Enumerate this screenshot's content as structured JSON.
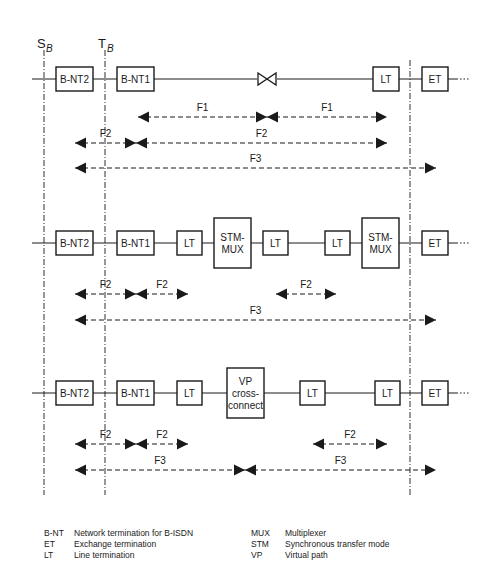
{
  "reference_points": [
    {
      "id": "sb",
      "label": "S",
      "sub": "B",
      "x": 44
    },
    {
      "id": "tb",
      "label": "T",
      "sub": "B",
      "x": 105
    }
  ],
  "boundary_x": 410,
  "rows": [
    {
      "y": 79,
      "line": [
        32,
        458
      ],
      "boxes": [
        {
          "label": [
            "B-NT2"
          ],
          "x": 56,
          "w": 37,
          "h": 24
        },
        {
          "label": [
            "B-NT1"
          ],
          "x": 117,
          "w": 37,
          "h": 24
        },
        {
          "label": [
            "LT"
          ],
          "x": 373,
          "w": 26,
          "h": 24
        },
        {
          "label": [
            "ET"
          ],
          "x": 422,
          "w": 26,
          "h": 24
        }
      ],
      "bowtie": {
        "x": 258,
        "w": 18
      },
      "arrows": [
        {
          "label": "F1",
          "y": 117,
          "x1": 138,
          "x2": 267,
          "left": "out",
          "right": "in"
        },
        {
          "label": "F1",
          "y": 117,
          "x1": 267,
          "x2": 387,
          "left": "in",
          "right": "out"
        },
        {
          "label": "F2",
          "y": 143,
          "x1": 75,
          "x2": 136,
          "left": "out",
          "right": "in"
        },
        {
          "label": "F2",
          "y": 143,
          "x1": 136,
          "x2": 387,
          "left": "in",
          "right": "out"
        },
        {
          "label": "F3",
          "y": 168,
          "x1": 75,
          "x2": 436,
          "left": "out",
          "right": "out"
        }
      ]
    },
    {
      "y": 243,
      "line": [
        32,
        458
      ],
      "boxes": [
        {
          "label": [
            "B-NT2"
          ],
          "x": 56,
          "w": 37,
          "h": 24
        },
        {
          "label": [
            "B-NT1"
          ],
          "x": 117,
          "w": 37,
          "h": 24
        },
        {
          "label": [
            "LT"
          ],
          "x": 177,
          "w": 25,
          "h": 24
        },
        {
          "label": [
            "STM-",
            "MUX"
          ],
          "x": 214,
          "w": 37,
          "h": 50
        },
        {
          "label": [
            "LT"
          ],
          "x": 263,
          "w": 25,
          "h": 24
        },
        {
          "label": [
            "LT"
          ],
          "x": 325,
          "w": 25,
          "h": 24
        },
        {
          "label": [
            "STM-",
            "MUX"
          ],
          "x": 362,
          "w": 37,
          "h": 50
        },
        {
          "label": [
            "ET"
          ],
          "x": 422,
          "w": 26,
          "h": 24
        }
      ],
      "arrows": [
        {
          "label": "F2",
          "y": 294,
          "x1": 75,
          "x2": 136,
          "left": "out",
          "right": "in"
        },
        {
          "label": "F2",
          "y": 294,
          "x1": 136,
          "x2": 188,
          "left": "in",
          "right": "out"
        },
        {
          "label": "F2",
          "y": 294,
          "x1": 276,
          "x2": 336,
          "left": "out",
          "right": "out"
        },
        {
          "label": "F3",
          "y": 320,
          "x1": 75,
          "x2": 436,
          "left": "out",
          "right": "out"
        }
      ]
    },
    {
      "y": 393,
      "line": [
        32,
        458
      ],
      "boxes": [
        {
          "label": [
            "B-NT2"
          ],
          "x": 56,
          "w": 37,
          "h": 24
        },
        {
          "label": [
            "B-NT1"
          ],
          "x": 117,
          "w": 37,
          "h": 24
        },
        {
          "label": [
            "LT"
          ],
          "x": 177,
          "w": 25,
          "h": 24
        },
        {
          "label": [
            "VP",
            "cross-",
            "connect"
          ],
          "x": 227,
          "w": 37,
          "h": 50
        },
        {
          "label": [
            "LT"
          ],
          "x": 300,
          "w": 25,
          "h": 24
        },
        {
          "label": [
            "LT"
          ],
          "x": 375,
          "w": 25,
          "h": 24
        },
        {
          "label": [
            "ET"
          ],
          "x": 422,
          "w": 26,
          "h": 24
        }
      ],
      "arrows": [
        {
          "label": "F2",
          "y": 444,
          "x1": 75,
          "x2": 136,
          "left": "out",
          "right": "in"
        },
        {
          "label": "F2",
          "y": 444,
          "x1": 136,
          "x2": 188,
          "left": "in",
          "right": "out"
        },
        {
          "label": "F2",
          "y": 444,
          "x1": 313,
          "x2": 387,
          "left": "out",
          "right": "out"
        },
        {
          "label": "F3",
          "y": 470,
          "x1": 75,
          "x2": 245,
          "left": "out",
          "right": "in"
        },
        {
          "label": "F3",
          "y": 470,
          "x1": 245,
          "x2": 436,
          "left": "in",
          "right": "out"
        }
      ]
    }
  ],
  "legend": {
    "left": [
      {
        "abbr": "B-NT",
        "desc": "Network termination for B-ISDN"
      },
      {
        "abbr": "ET",
        "desc": "Exchange termination"
      },
      {
        "abbr": "LT",
        "desc": "Line termination"
      }
    ],
    "right": [
      {
        "abbr": "MUX",
        "desc": "Multiplexer"
      },
      {
        "abbr": "STM",
        "desc": "Synchronous transfer mode"
      },
      {
        "abbr": "VP",
        "desc": "Virtual path"
      }
    ]
  }
}
